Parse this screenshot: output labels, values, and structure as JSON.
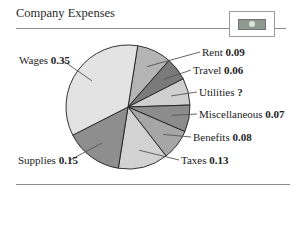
{
  "header": {
    "title": "Company Expenses",
    "badge_icon": "money-bill-icon"
  },
  "chart_data": {
    "type": "pie",
    "title": "Company Expenses",
    "categories": [
      "Rent",
      "Travel",
      "Utilities",
      "Miscellaneous",
      "Benefits",
      "Taxes",
      "Supplies",
      "Wages"
    ],
    "values": [
      0.09,
      0.06,
      null,
      0.07,
      0.08,
      0.13,
      0.15,
      0.35
    ],
    "value_labels": [
      "0.09",
      "0.06",
      "?",
      "0.07",
      "0.08",
      "0.13",
      "0.15",
      "0.35"
    ],
    "inferred_missing_value": {
      "Utilities": 0.07
    },
    "start_angle_deg_clockwise_from_top": 9,
    "direction": "clockwise",
    "colors": [
      "#b4b4b4",
      "#7a7a7a",
      "#cfcfcf",
      "#8c8c8c",
      "#a6a6a6",
      "#d2d2d2",
      "#8e8e8e",
      "#e3e3e3"
    ],
    "legend": "leader-line labels"
  },
  "labels": {
    "rent": {
      "name": "Rent",
      "value": "0.09"
    },
    "travel": {
      "name": "Travel",
      "value": "0.06"
    },
    "utilities": {
      "name": "Utilities",
      "value": "?"
    },
    "miscellaneous": {
      "name": "Miscellaneous",
      "value": "0.07"
    },
    "benefits": {
      "name": "Benefits",
      "value": "0.08"
    },
    "taxes": {
      "name": "Taxes",
      "value": "0.13"
    },
    "supplies": {
      "name": "Supplies",
      "value": "0.15"
    },
    "wages": {
      "name": "Wages",
      "value": "0.35"
    }
  }
}
